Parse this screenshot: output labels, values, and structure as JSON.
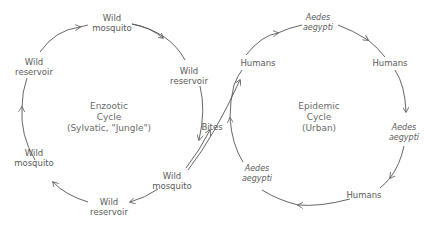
{
  "diagram": {
    "enzootic": {
      "title": [
        "Enzootic",
        "Cycle",
        "(Sylvatic, \"Jungle\")"
      ],
      "nodes": [
        {
          "l1": "Wild",
          "l2": "mosquito"
        },
        {
          "l1": "Wild",
          "l2": "reservoir"
        },
        {
          "l1": "Wild",
          "l2": "mosquito"
        },
        {
          "l1": "Wild",
          "l2": "reservoir"
        },
        {
          "l1": "Wild",
          "l2": "mosquito"
        },
        {
          "l1": "Wild",
          "l2": "reservoir"
        }
      ]
    },
    "bridge": {
      "label": "Bites"
    },
    "epidemic": {
      "title": [
        "Epidemic",
        "Cycle",
        "(Urban)"
      ],
      "nodes": [
        {
          "l1": "Aedes",
          "l2": "aegypti"
        },
        {
          "l1": "Humans"
        },
        {
          "l1": "Aedes",
          "l2": "aegypti"
        },
        {
          "l1": "Humans"
        },
        {
          "l1": "Aedes",
          "l2": "aegypti"
        },
        {
          "l1": "Humans"
        }
      ]
    },
    "colors": {
      "line": "#555555",
      "text": "#5a5a5a"
    }
  }
}
